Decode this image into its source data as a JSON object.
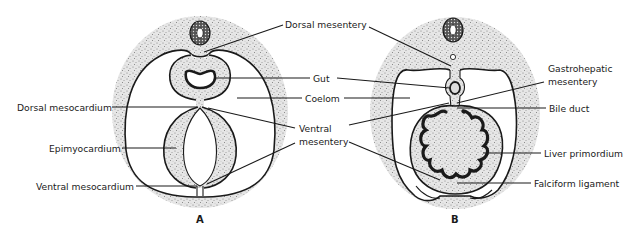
{
  "figure": {
    "panels": [
      {
        "id": "A",
        "label": "A",
        "labels": {
          "dorsal_mesentery": "Dorsal mesentery",
          "gut": "Gut",
          "coelom": "Coelom",
          "dorsal_mesocardium": "Dorsal mesocardium",
          "ventral_mesentery_line1": "Ventral",
          "ventral_mesentery_line2": "mesentery",
          "epimyocardium": "Epimyocardium",
          "ventral_mesocardium": "Ventral mesocardium"
        }
      },
      {
        "id": "B",
        "label": "B",
        "labels": {
          "gastrohepatic_mesentery_line1": "Gastrohepatic",
          "gastrohepatic_mesentery_line2": "mesentery",
          "bile_duct": "Bile duct",
          "liver_primordium": "Liver primordium",
          "falciform_ligament": "Falciform ligament"
        }
      }
    ],
    "colors": {
      "ink": "#1a1a1a",
      "stipple_base": "#e4e4e4",
      "background": "#ffffff"
    }
  }
}
